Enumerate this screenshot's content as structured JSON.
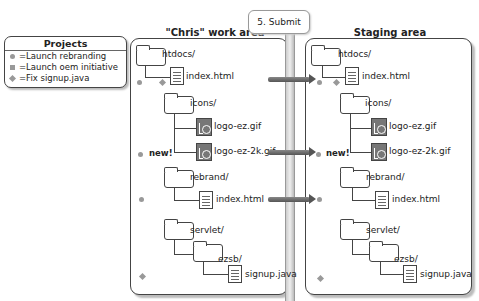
{
  "legend": {
    "title": "Projects",
    "items": [
      {
        "marker": "circle",
        "label": "=Launch rebranding"
      },
      {
        "marker": "square",
        "label": "=Launch oem initiative"
      },
      {
        "marker": "diamond",
        "label": "=Fix signup.java"
      }
    ]
  },
  "callout": {
    "label": "5. Submit"
  },
  "work_area": {
    "title": "\"Chris\" work area",
    "items": {
      "htdocs": "htdocs/",
      "index1": "index.html",
      "icons": "icons/",
      "logo1": "logo-ez.gif",
      "logo2": "logo-ez-2k.gif",
      "new_label": "new!",
      "rebrand": "rebrand/",
      "index2": "index.html",
      "servlet": "servlet/",
      "ezsb": "ezsb/",
      "signup": "signup.java"
    }
  },
  "staging_area": {
    "title": "Staging area",
    "items": {
      "htdocs": "htdocs/",
      "index1": "index.html",
      "icons": "icons/",
      "logo1": "logo-ez.gif",
      "logo2": "logo-ez-2k.gif",
      "new_label": "new!",
      "rebrand": "rebrand/",
      "index2": "index.html",
      "servlet": "servlet/",
      "ezsb": "ezsb/",
      "signup": "signup.java"
    }
  }
}
